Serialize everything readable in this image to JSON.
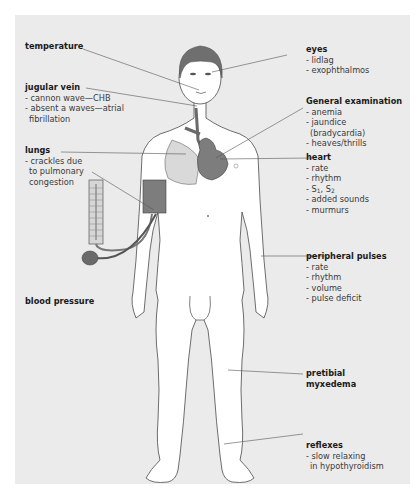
{
  "diagram": {
    "colors": {
      "panel": "#ebebeb",
      "skin": "#ffffff",
      "outline": "#4a4a4a",
      "hair": "#6f6f6f",
      "organ": "#7d7d7d",
      "lung": "#d9d9d9",
      "leader": "#555555"
    },
    "labels": {
      "temperature": {
        "title": "temperature"
      },
      "jugular_vein": {
        "title": "jugular vein",
        "items": [
          "- cannon wave—CHB",
          "- absent a waves—atrial",
          "fibrillation"
        ]
      },
      "lungs": {
        "title": "lungs",
        "items": [
          "- crackles due",
          "to pulmonary",
          "congestion"
        ]
      },
      "blood_pressure": {
        "title": "blood pressure"
      },
      "eyes": {
        "title": "eyes",
        "items": [
          "- lidlag",
          "- exophthalmos"
        ]
      },
      "general_examination": {
        "title": "General examination",
        "items": [
          "- anemia",
          "- jaundice",
          "(bradycardia)",
          "- heaves/thrills"
        ]
      },
      "heart": {
        "title": "heart",
        "items": [
          "- rate",
          "- rhythm",
          "- S",
          "1",
          ", S",
          "2",
          "- added sounds",
          "- murmurs"
        ]
      },
      "peripheral_pulses": {
        "title": "peripheral pulses",
        "items": [
          "- rate",
          "- rhythm",
          "- volume",
          "- pulse deficit"
        ]
      },
      "pretibial": {
        "title": "pretibial",
        "title2": "myxedema"
      },
      "reflexes": {
        "title": "reflexes",
        "items": [
          "- slow relaxing",
          "in hypothyroidism"
        ]
      }
    }
  }
}
